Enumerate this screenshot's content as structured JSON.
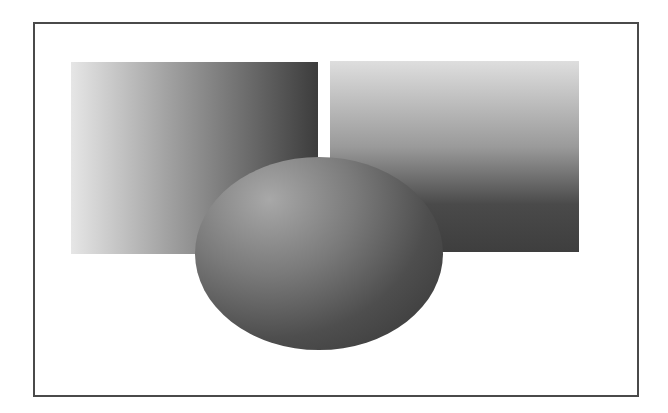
{
  "figure": {
    "frame": {
      "border_color": "#4a4a4a",
      "background": "#ffffff"
    },
    "shapes": [
      {
        "name": "left-rectangle",
        "type": "rectangle",
        "gradient": "horizontal light-to-dark",
        "from": "#e6e6e6",
        "to": "#3c3c3c"
      },
      {
        "name": "right-rectangle",
        "type": "rectangle",
        "gradient": "vertical light-to-dark",
        "from": "#dedede",
        "to": "#3e3e3e"
      },
      {
        "name": "ellipse",
        "type": "ellipse",
        "gradient": "radial light upper-left to dark",
        "from": "#a8a8a8",
        "to": "#333333"
      }
    ]
  }
}
